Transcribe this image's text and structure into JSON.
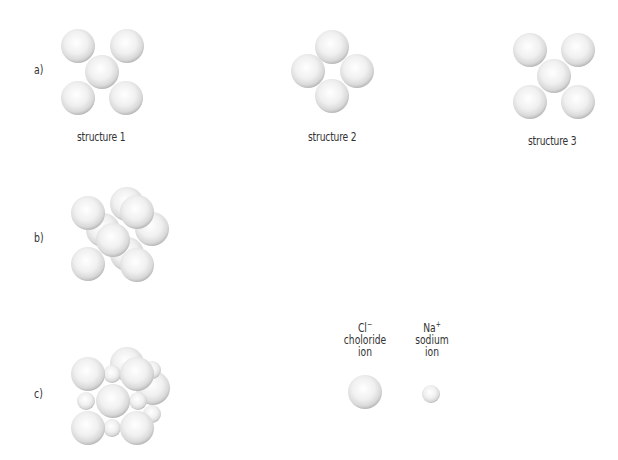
{
  "parts": {
    "a": "a)",
    "b": "b)",
    "c": "c)"
  },
  "structures": [
    {
      "label": "structure 1"
    },
    {
      "label": "structure 2"
    },
    {
      "label": "structure 3"
    }
  ],
  "legend": {
    "chloride": {
      "symbol": "Cl",
      "charge": "−",
      "line1": "choloride",
      "line2": "ion"
    },
    "sodium": {
      "symbol": "Na",
      "charge": "+",
      "line1": "sodium",
      "line2": "ion"
    }
  },
  "colors": {
    "sphere_highlight": "#ffffff",
    "sphere_mid": "#ebebeb",
    "sphere_edge": "#bdbdbd",
    "text": "#333333"
  }
}
